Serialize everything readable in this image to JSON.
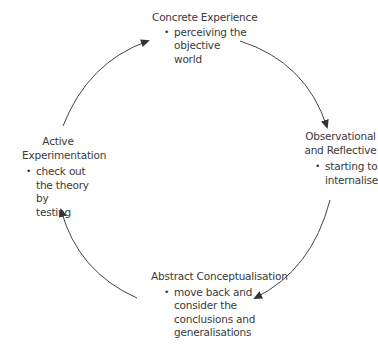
{
  "diagram": {
    "type": "cycle",
    "title": "",
    "stages": [
      {
        "id": "concrete-experience",
        "title": "Concrete Experience",
        "bullet_lines": [
          "perceiving the",
          "objective",
          "world"
        ],
        "bullet": "perceiving the objective world",
        "position": "top"
      },
      {
        "id": "observational-reflective",
        "title_lines": [
          "Observational",
          "and Reflective"
        ],
        "title": "Observational and Reflective",
        "bullet_lines": [
          "starting to",
          "internalise"
        ],
        "bullet": "starting to internalise",
        "position": "right"
      },
      {
        "id": "abstract-conceptualisation",
        "title": "Abstract Conceptualisation",
        "bullet_lines": [
          "move back and",
          "consider the",
          "conclusions and",
          "generalisations"
        ],
        "bullet": "move back and consider the conclusions and generalisations",
        "position": "bottom"
      },
      {
        "id": "active-experimentation",
        "title_lines": [
          "Active",
          "Experimentation"
        ],
        "title": "Active Experimentation",
        "bullet_lines": [
          "check out",
          "the theory by",
          "testing"
        ],
        "bullet": "check out the theory by testing",
        "position": "left"
      }
    ],
    "edges": [
      {
        "from": "active-experimentation",
        "to": "concrete-experience",
        "direction": "clockwise"
      },
      {
        "from": "concrete-experience",
        "to": "observational-reflective",
        "direction": "clockwise"
      },
      {
        "from": "observational-reflective",
        "to": "abstract-conceptualisation",
        "direction": "clockwise"
      },
      {
        "from": "abstract-conceptualisation",
        "to": "active-experimentation",
        "direction": "clockwise"
      }
    ],
    "colors": {
      "text": "#3a3a3a",
      "arrow": "#333333",
      "background": "#ffffff"
    }
  }
}
